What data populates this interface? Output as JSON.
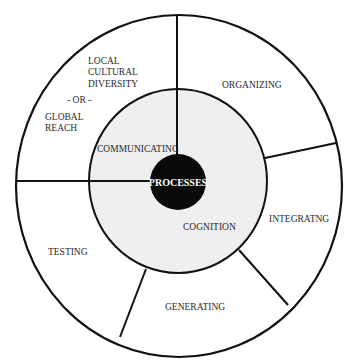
{
  "diagram": {
    "center_label": "PROCESSES",
    "inner_ring": {
      "fill": "#efefef",
      "labels": [
        "COMMUNICATING",
        "COGNITION"
      ]
    },
    "outer_segments": [
      {
        "id": "local-global",
        "lines": [
          "LOCAL",
          "CULTURAL",
          "DIVERSITY",
          "- OR -",
          "GLOBAL",
          "REACH"
        ]
      },
      {
        "id": "organizing",
        "lines": [
          "ORGANIZING"
        ]
      },
      {
        "id": "integrating",
        "lines": [
          "INTEGRATNG"
        ]
      },
      {
        "id": "generating",
        "lines": [
          "GENERATING"
        ]
      },
      {
        "id": "testing",
        "lines": [
          "TESTING"
        ]
      }
    ],
    "colors": {
      "stroke": "#111111",
      "center_fill": "#0a0a0a",
      "inner_fill": "#efefef"
    }
  }
}
